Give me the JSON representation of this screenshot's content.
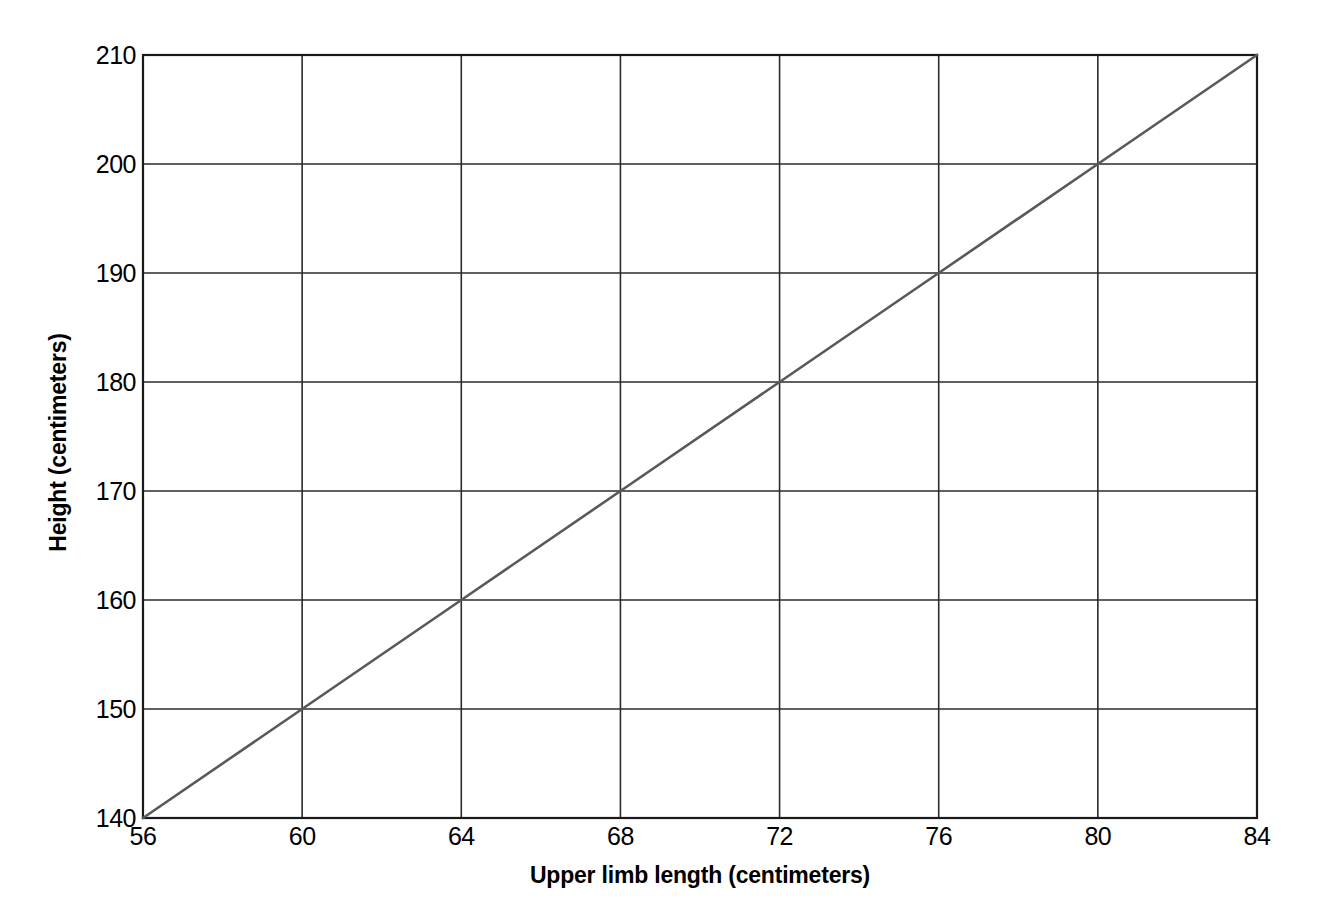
{
  "chart_data": {
    "type": "line",
    "title": "",
    "xlabel": "Upper limb length (centimeters)",
    "ylabel": "Height (centimeters)",
    "xlim": [
      56,
      84
    ],
    "ylim": [
      140,
      210
    ],
    "xticks": [
      56,
      60,
      64,
      68,
      72,
      76,
      80,
      84
    ],
    "yticks": [
      140,
      150,
      160,
      170,
      180,
      190,
      200,
      210
    ],
    "xtick_labels": [
      "56",
      "60",
      "64",
      "68",
      "72",
      "76",
      "80",
      "84"
    ],
    "ytick_labels": [
      "140",
      "150",
      "160",
      "170",
      "180",
      "190",
      "200",
      "210"
    ],
    "grid": true,
    "legend": "none",
    "series": [
      {
        "name": "Height vs upper limb length",
        "x": [
          56,
          60,
          64,
          68,
          72,
          76,
          80,
          84
        ],
        "values": [
          140,
          150,
          160,
          170,
          180,
          190,
          200,
          210
        ]
      }
    ]
  },
  "style": {
    "background": "#ffffff",
    "axis_color": "#1a1a1a",
    "grid_color": "#2b2b2b",
    "line_color": "#595959",
    "text_color": "#000000"
  }
}
